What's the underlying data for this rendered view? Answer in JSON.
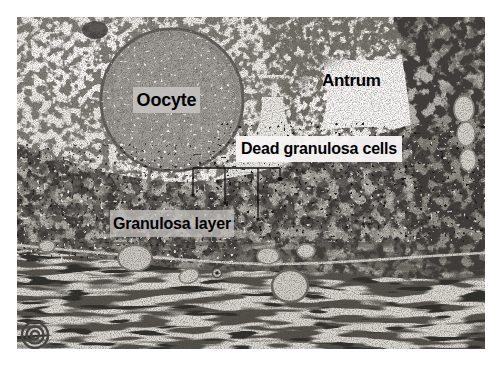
{
  "figure": {
    "kind": "histology-micrograph",
    "labels": {
      "oocyte": "Oocyte",
      "antrum": "Antrum",
      "dead_granulosa_cells": "Dead granulosa cells",
      "granulosa_layer": "Granulosa layer"
    },
    "colors": {
      "page_background": "#ffffff",
      "label_text": "#000000",
      "oocyte_label_bg": "#c4c2bf",
      "dead_cells_label_bg": "#f7f6f4",
      "granulosa_label_bg": "#c1bfbb",
      "photo_base": "#edebe6"
    }
  }
}
